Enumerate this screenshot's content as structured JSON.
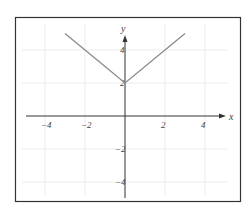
{
  "chart_data": {
    "type": "line",
    "title": "",
    "function": "y = |x| + 2",
    "xlabel": "x",
    "ylabel": "y",
    "xlim": [
      -5,
      5
    ],
    "ylim": [
      -5,
      5.5
    ],
    "grid": true,
    "x_ticks": [
      -4,
      -2,
      2,
      4
    ],
    "y_ticks": [
      4,
      2,
      -2,
      -4
    ],
    "x_tick_labels": [
      "−4",
      "−2",
      "2",
      "4"
    ],
    "y_tick_labels": [
      "4",
      "2",
      "−2",
      "−4"
    ],
    "series": [
      {
        "name": "y = |x| + 2",
        "x": [
          -3,
          0,
          3
        ],
        "y": [
          5,
          2,
          5
        ]
      }
    ],
    "colors": {
      "line": "#8a8a8a",
      "axis": "#333333",
      "grid": "#ececec",
      "frame": "#333333"
    }
  }
}
